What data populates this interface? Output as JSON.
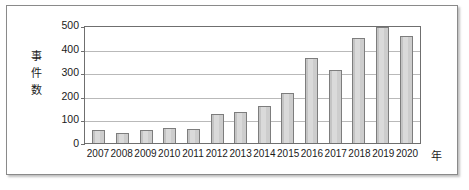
{
  "chart_data": {
    "type": "bar",
    "title": "",
    "xlabel": "年",
    "ylabel": "事件数",
    "ylabel_chars": [
      "事",
      "件",
      "数"
    ],
    "categories": [
      "2007",
      "2008",
      "2009",
      "2010",
      "2011",
      "2012",
      "2013",
      "2014",
      "2015",
      "2016",
      "2017",
      "2018",
      "2019",
      "2020"
    ],
    "values": [
      55,
      42,
      55,
      65,
      60,
      122,
      130,
      157,
      213,
      360,
      310,
      445,
      493,
      455
    ],
    "ylim": [
      0,
      500
    ],
    "yticks": [
      0,
      100,
      200,
      300,
      400,
      500
    ],
    "ytick_labels": [
      "0",
      "100",
      "200",
      "300",
      "400",
      "500"
    ],
    "gridlines": [
      100,
      200,
      300,
      400
    ],
    "grid": true,
    "legend": false,
    "legend_position": "none",
    "series": [
      {
        "name": "事件数",
        "values": [
          55,
          42,
          55,
          65,
          60,
          122,
          130,
          157,
          213,
          360,
          310,
          445,
          493,
          455
        ]
      }
    ],
    "colors": {
      "bar_fill": "#d2d2d2",
      "bar_border": "#7d7d7d",
      "gridline": "#b9b9b9",
      "axis": "#6f6f6f",
      "text": "#1a1a1a",
      "frame": "#8a8a8a",
      "background": "#ffffff"
    }
  },
  "caption": {
    "text": ""
  }
}
